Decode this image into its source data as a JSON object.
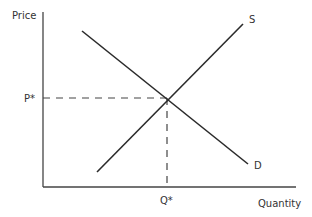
{
  "diagram": {
    "type": "supply-demand",
    "axes": {
      "y_label": "Price",
      "x_label": "Quantity"
    },
    "curves": [
      {
        "name": "Supply",
        "label": "S",
        "from": [
          97,
          172
        ],
        "to": [
          243,
          24
        ]
      },
      {
        "name": "Demand",
        "label": "D",
        "from": [
          82,
          31
        ],
        "to": [
          248,
          164
        ]
      }
    ],
    "equilibrium": {
      "price_label": "P*",
      "quantity_label": "Q*",
      "point": [
        167,
        98
      ]
    },
    "colors": {
      "line": "#2b2b2b",
      "axis": "#444444",
      "text": "#333333"
    }
  }
}
